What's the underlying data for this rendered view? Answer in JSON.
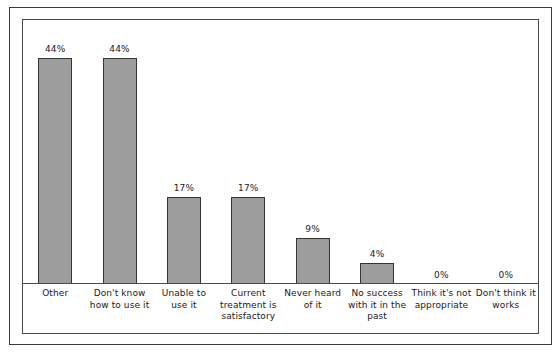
{
  "chart_data": {
    "type": "bar",
    "title": "",
    "subtitle": "",
    "xlabel": "",
    "ylabel": "",
    "ylim": [
      0,
      50
    ],
    "grid": false,
    "legend": "none",
    "orientation": "vertical",
    "value_labels_shown": true,
    "categories": [
      "Other",
      "Don't know how to use it",
      "Unable to use it",
      "Current treatment is satisfactory",
      "Never heard of it",
      "No success with it in the past",
      "Think it's not appropriate",
      "Don't think it works"
    ],
    "values": [
      44,
      44,
      17,
      17,
      9,
      4,
      0,
      0
    ],
    "value_label_text": [
      "44%",
      "44%",
      "17%",
      "17%",
      "9%",
      "4%",
      "0%",
      "0%"
    ],
    "tick_labels": [],
    "colors": {
      "bar_fill": "#9d9d9d",
      "bar_edge": "#353535",
      "text": "#1a1a1a",
      "outer_frame": "#3a3a3a",
      "inner_frame": "#4a4a4a",
      "background": "#ffffff"
    }
  }
}
